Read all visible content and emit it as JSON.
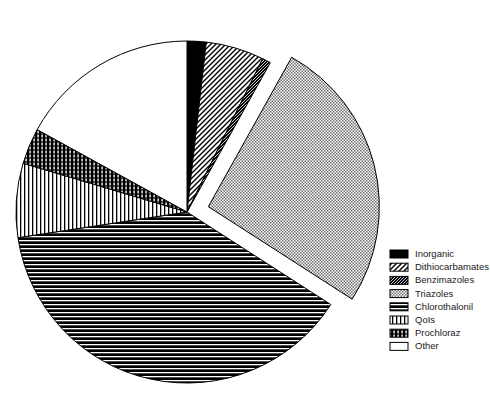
{
  "chart_data": {
    "type": "pie",
    "title": "",
    "subtitle": "",
    "xlabel": "",
    "ylabel": "",
    "grid": false,
    "legend_position": "right",
    "exploded_slices": [
      "Triazoles"
    ],
    "start_angle_deg": -90,
    "direction": "clockwise",
    "categories": [
      "Inorganic",
      "Dithiocarbamates",
      "Benzimazoles",
      "Triazoles",
      "Chlorothalonil",
      "QoIs",
      "Prochloraz",
      "Other"
    ],
    "values": [
      1.8,
      5.5,
      0.8,
      26.0,
      38.5,
      7.0,
      3.4,
      17.0
    ],
    "units": "percent",
    "slices": [
      {
        "label": "Inorganic",
        "value": 1.8,
        "pattern": "solid-black",
        "fill": "#000000"
      },
      {
        "label": "Dithiocarbamates",
        "value": 5.5,
        "pattern": "diagonal-hatch",
        "fill": "#ffffff"
      },
      {
        "label": "Benzimazoles",
        "value": 0.8,
        "pattern": "dense-diagonal",
        "fill": "#1a1a1a"
      },
      {
        "label": "Triazoles",
        "value": 26.0,
        "pattern": "fine-checker-gray",
        "fill": "#a8a8a8"
      },
      {
        "label": "Chlorothalonil",
        "value": 38.5,
        "pattern": "horizontal-lines",
        "fill": "#000000"
      },
      {
        "label": "QoIs",
        "value": 7.0,
        "pattern": "vertical-lines",
        "fill": "#ffffff"
      },
      {
        "label": "Prochloraz",
        "value": 3.4,
        "pattern": "dense-crosshatch",
        "fill": "#000000"
      },
      {
        "label": "Other",
        "value": 17.0,
        "pattern": "plain-white",
        "fill": "#ffffff"
      }
    ]
  },
  "legend": {
    "items": [
      {
        "label": "Inorganic",
        "pattern": "solid-black"
      },
      {
        "label": "Dithiocarbamates",
        "pattern": "diagonal-hatch"
      },
      {
        "label": "Benzimazoles",
        "pattern": "dense-diagonal"
      },
      {
        "label": "Triazoles",
        "pattern": "fine-checker-gray"
      },
      {
        "label": "Chlorothalonil",
        "pattern": "horizontal-lines"
      },
      {
        "label": "QoIs",
        "pattern": "vertical-lines"
      },
      {
        "label": "Prochloraz",
        "pattern": "dense-crosshatch"
      },
      {
        "label": "Other",
        "pattern": "plain-white"
      }
    ]
  },
  "colors": {
    "background": "#ffffff",
    "outline": "#000000",
    "text": "#1a1a1a",
    "gray_fill": "#a8a8a8"
  }
}
